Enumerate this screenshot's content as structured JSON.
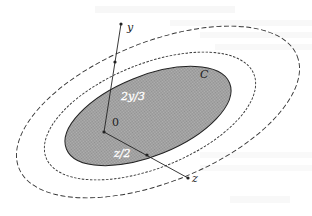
{
  "figure": {
    "region_label": "C",
    "origin_label": "0",
    "y_point_label": "y",
    "z_point_label": "z",
    "y_fraction_label": "2y/3",
    "z_fraction_label": "z/2"
  },
  "colors": {
    "shaded_fill": "#a8a8a8",
    "stroke": "#222222",
    "dashed_stroke": "#333333"
  },
  "geometry": {
    "center": [
      104,
      132
    ],
    "rotation_deg": -28,
    "ellipses": [
      {
        "name": "shaded-set-C",
        "rx": 86,
        "ry": 44,
        "cx": 150,
        "cy": 116,
        "style": "solid-filled"
      },
      {
        "name": "inner-dashed",
        "rx": 118,
        "ry": 62,
        "cx": 150,
        "cy": 108,
        "style": "short-dash"
      },
      {
        "name": "outer-dashed",
        "rx": 152,
        "ry": 80,
        "cx": 152,
        "cy": 104,
        "style": "long-dash"
      }
    ],
    "y_point": [
      121,
      24
    ],
    "y_scaled_point": [
      110,
      85
    ],
    "z_point": [
      188,
      178
    ],
    "z_scaled_point": [
      146,
      154
    ]
  }
}
